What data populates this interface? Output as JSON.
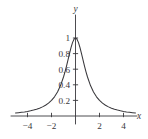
{
  "chart_data": {
    "type": "line",
    "title": "",
    "subtitle": "",
    "xlabel": "x",
    "ylabel": "y",
    "xlim": [
      -5.2,
      5.2
    ],
    "ylim": [
      -0.12,
      1.14
    ],
    "grid": false,
    "legend": null,
    "xticks": [
      -4,
      -2,
      2,
      4
    ],
    "xticklabels": [
      "-4",
      "-2",
      "2",
      "4"
    ],
    "yticks": [
      0.2,
      0.4,
      0.6,
      0.8,
      1
    ],
    "yticklabels": [
      "0.2",
      "0.4",
      "0.6",
      "0.8",
      "1"
    ],
    "series": [
      {
        "name": "y = 1/(x^2+1)",
        "color": "#39383c",
        "x": [
          -5,
          -4.75,
          -4.5,
          -4.25,
          -4,
          -3.75,
          -3.5,
          -3.25,
          -3,
          -2.75,
          -2.5,
          -2.25,
          -2,
          -1.75,
          -1.5,
          -1.25,
          -1,
          -0.875,
          -0.75,
          -0.625,
          -0.5,
          -0.375,
          -0.25,
          -0.125,
          0,
          0.125,
          0.25,
          0.375,
          0.5,
          0.625,
          0.75,
          0.875,
          1,
          1.25,
          1.5,
          1.75,
          2,
          2.25,
          2.5,
          2.75,
          3,
          3.25,
          3.5,
          3.75,
          4,
          4.25,
          4.5,
          4.75,
          5
        ],
        "y": [
          0.0385,
          0.0425,
          0.047,
          0.0524,
          0.0588,
          0.0664,
          0.0755,
          0.0865,
          0.1,
          0.1168,
          0.1379,
          0.1649,
          0.2,
          0.2462,
          0.3077,
          0.3902,
          0.5,
          0.5664,
          0.64,
          0.7191,
          0.8,
          0.8767,
          0.9412,
          0.9846,
          1,
          0.9846,
          0.9412,
          0.8767,
          0.8,
          0.7191,
          0.64,
          0.5664,
          0.5,
          0.3902,
          0.3077,
          0.2462,
          0.2,
          0.1649,
          0.1379,
          0.1168,
          0.1,
          0.0865,
          0.0755,
          0.0664,
          0.0588,
          0.0524,
          0.047,
          0.0425,
          0.0385
        ]
      }
    ],
    "annotations": []
  },
  "axes": {
    "x_axis_label": "x",
    "y_axis_label": "y"
  },
  "ticks": {
    "x": [
      {
        "value": -4,
        "label": "-4"
      },
      {
        "value": -2,
        "label": "-2"
      },
      {
        "value": 2,
        "label": "2"
      },
      {
        "value": 4,
        "label": "4"
      }
    ],
    "y": [
      {
        "value": 0.2,
        "label": "0.2"
      },
      {
        "value": 0.4,
        "label": "0.4"
      },
      {
        "value": 0.6,
        "label": "0.6"
      },
      {
        "value": 0.8,
        "label": "0.8"
      },
      {
        "value": 1,
        "label": "1"
      }
    ]
  },
  "style": {
    "background": "#ffffff",
    "ink": "#39383c",
    "curve_color": "#39383c"
  }
}
